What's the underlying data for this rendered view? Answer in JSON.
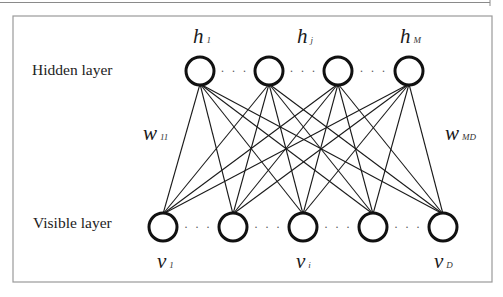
{
  "diagram": {
    "type": "restricted-boltzmann-machine",
    "layers": {
      "hidden": {
        "label": "Hidden layer",
        "nodes": [
          {
            "id": "h1",
            "x": 200,
            "y": 71
          },
          {
            "id": "h2",
            "x": 269,
            "y": 71
          },
          {
            "id": "h3",
            "x": 338,
            "y": 71
          },
          {
            "id": "h4",
            "x": 409,
            "y": 71
          }
        ],
        "ellipsis": "· · ·",
        "node_labels": [
          {
            "base": "h",
            "sub": "1",
            "x": 193,
            "y": 43
          },
          {
            "base": "h",
            "sub": "j",
            "x": 297,
            "y": 43
          },
          {
            "base": "h",
            "sub": "M",
            "x": 400,
            "y": 43
          }
        ]
      },
      "visible": {
        "label": "Visible layer",
        "nodes": [
          {
            "id": "v1",
            "x": 163,
            "y": 227
          },
          {
            "id": "v2",
            "x": 233,
            "y": 227
          },
          {
            "id": "v3",
            "x": 303,
            "y": 227
          },
          {
            "id": "v4",
            "x": 373,
            "y": 227
          },
          {
            "id": "v5",
            "x": 443,
            "y": 227
          }
        ],
        "ellipsis": "· · ·",
        "node_labels": [
          {
            "base": "v",
            "sub": "1",
            "x": 157,
            "y": 268
          },
          {
            "base": "v",
            "sub": "i",
            "x": 296,
            "y": 268
          },
          {
            "base": "v",
            "sub": "D",
            "x": 434,
            "y": 268
          }
        ]
      }
    },
    "weights": [
      {
        "base": "w",
        "sub": "11",
        "x": 143,
        "y": 140
      },
      {
        "base": "w",
        "sub": "MD",
        "x": 445,
        "y": 140
      }
    ],
    "connectivity": "fully-connected",
    "node_radius": 14
  }
}
